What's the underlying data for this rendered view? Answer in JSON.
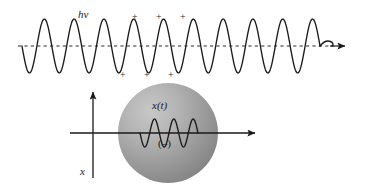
{
  "figure": {
    "background_color": "#ffffff",
    "ink_color": "#1a1a1a"
  },
  "wave": {
    "label": "hν",
    "label_name": "photon-energy-label",
    "cycles": 10,
    "x_start": 22,
    "x_end": 320,
    "baseline_y": 46,
    "amplitude": 27,
    "axis_style": "dashed",
    "arrow_tip_x": 345,
    "stroke_color": "#1a1a1a"
  },
  "charges": {
    "top_label": "+",
    "bottom_label": "+",
    "top_positions": [
      134,
      158,
      182
    ],
    "top_y": 12,
    "bottom_positions": [
      122,
      146,
      170
    ],
    "bottom_y": 70,
    "color": "#2a2a2a"
  },
  "sphere": {
    "center_x": 168,
    "center_y": 133,
    "radius": 50,
    "fill_light": "#c2c2c2",
    "fill_mid": "#a3a3a3",
    "fill_dark": "#878787",
    "edge_color": "#7d7d7d"
  },
  "sphere_labels": {
    "displacement": "x(t)",
    "charge_sign": "(–)"
  },
  "axes": {
    "vertical_label": "x",
    "vertical_x": 93,
    "vertical_top_y": 92,
    "vertical_bottom_y": 178,
    "horizontal_y": 133,
    "horizontal_x_start": 70,
    "horizontal_arrow_tip_x": 255,
    "stroke_color": "#1a1a1a"
  },
  "inner_oscillation": {
    "cycles": 3,
    "x_start": 140,
    "x_end": 198,
    "center_y": 133,
    "amplitude": 14,
    "stroke_color": "#1a1a1a"
  },
  "chart_data": {
    "type": "line",
    "title": "hν",
    "xlabel": "",
    "ylabel": "x",
    "series": [
      {
        "name": "incident-light-wave",
        "description": "sinusoidal electromagnetic wave travelling to the right",
        "cycles": 10,
        "amplitude": 27,
        "x_range": [
          22,
          320
        ],
        "baseline": 46
      },
      {
        "name": "induced-charge-displacement",
        "description": "x(t) oscillation of the negative charge cloud inside the sphere",
        "cycles": 3,
        "amplitude": 14,
        "x_range": [
          140,
          198
        ],
        "baseline": 133
      }
    ],
    "annotations": [
      {
        "text": "hν",
        "x": 88,
        "y": 14
      },
      {
        "text": "+",
        "x": 134,
        "y": 14
      },
      {
        "text": "+",
        "x": 158,
        "y": 14
      },
      {
        "text": "+",
        "x": 182,
        "y": 14
      },
      {
        "text": "+",
        "x": 122,
        "y": 74
      },
      {
        "text": "+",
        "x": 146,
        "y": 74
      },
      {
        "text": "+",
        "x": 170,
        "y": 74
      },
      {
        "text": "x(t)",
        "x": 160,
        "y": 105
      },
      {
        "text": "(–)",
        "x": 164,
        "y": 143
      },
      {
        "text": "x",
        "x": 84,
        "y": 172
      }
    ],
    "grid": false,
    "legend": "none"
  }
}
